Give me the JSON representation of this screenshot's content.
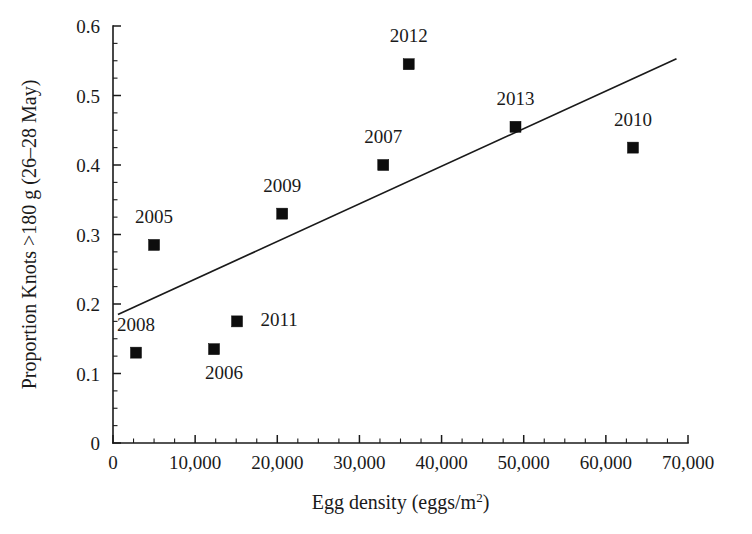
{
  "chart_data": {
    "type": "scatter",
    "title": "",
    "xlabel": "Egg density (eggs/m2)",
    "xlabel_base": "Egg density (eggs/m",
    "xlabel_sup": "2",
    "xlabel_tail": ")",
    "ylabel": "Proportion Knots >180 g (26–28 May)",
    "xlim": [
      0,
      70000
    ],
    "ylim": [
      0,
      0.6
    ],
    "grid": false,
    "legend": "none",
    "x_ticks": [
      0,
      10000,
      20000,
      30000,
      40000,
      50000,
      60000,
      70000
    ],
    "x_tick_labels": [
      "0",
      "10,000",
      "20,000",
      "30,000",
      "40,000",
      "50,000",
      "60,000",
      "70,000"
    ],
    "x_minor_interval": 2500,
    "y_ticks": [
      0,
      0.1,
      0.2,
      0.3,
      0.4,
      0.5,
      0.6
    ],
    "y_tick_labels": [
      "0",
      "0.1",
      "0.2",
      "0.3",
      "0.4",
      "0.5",
      "0.6"
    ],
    "y_minor_interval": 0.025,
    "marker_shape": "square",
    "marker_color": "#0d0d0d",
    "line_color": "#1a1a1a",
    "points": [
      {
        "label": "2005",
        "x": 5000,
        "y": 0.285,
        "label_dx": 0,
        "label_dy": -22
      },
      {
        "label": "2006",
        "x": 12300,
        "y": 0.135,
        "label_dx": 10,
        "label_dy": 30
      },
      {
        "label": "2007",
        "x": 32900,
        "y": 0.4,
        "label_dx": 0,
        "label_dy": -22
      },
      {
        "label": "2008",
        "x": 2800,
        "y": 0.13,
        "label_dx": 0,
        "label_dy": -22
      },
      {
        "label": "2009",
        "x": 20600,
        "y": 0.33,
        "label_dx": 0,
        "label_dy": -22
      },
      {
        "label": "2010",
        "x": 63300,
        "y": 0.425,
        "label_dx": 0,
        "label_dy": -22
      },
      {
        "label": "2011",
        "x": 15100,
        "y": 0.175,
        "label_dx": 42,
        "label_dy": 5
      },
      {
        "label": "2012",
        "x": 36000,
        "y": 0.545,
        "label_dx": 0,
        "label_dy": -22
      },
      {
        "label": "2013",
        "x": 49000,
        "y": 0.455,
        "label_dx": 0,
        "label_dy": -22
      }
    ],
    "trend_line": {
      "x_start": 600,
      "y_start": 0.185,
      "x_end": 68600,
      "y_end": 0.553
    }
  }
}
